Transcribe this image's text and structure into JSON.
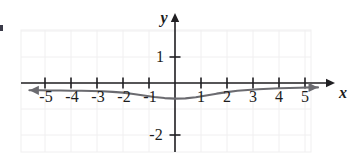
{
  "figure": {
    "kind": "cartesian-graph",
    "width": 349,
    "height": 159,
    "background": "#ffffff",
    "grid_color": "#f0eff0",
    "axis_color": "#201f22",
    "curve_color": "#6b6b70",
    "text_color": "#1c1c1c"
  },
  "axes": {
    "x_axis_label": "x",
    "y_axis_label": "y",
    "x_tick_labels": [
      "-5",
      "-4",
      "-3",
      "-2",
      "-1",
      "1",
      "2",
      "3",
      "4",
      "5"
    ],
    "y_tick_labels": [
      "1",
      "-2"
    ],
    "x_range": [
      -5.9,
      6.0
    ],
    "y_range": [
      -2.8,
      2.9
    ],
    "x_ticks": [
      -5,
      -4,
      -3,
      -2,
      -1,
      1,
      2,
      3,
      4,
      5
    ],
    "y_ticks": [
      1,
      -2
    ],
    "grid": true
  },
  "chart_data": {
    "type": "line",
    "title": "",
    "xlabel": "x",
    "ylabel": "y",
    "xlim": [
      -5.9,
      6.0
    ],
    "ylim": [
      -2.8,
      2.9
    ],
    "grid": true,
    "legend": "none",
    "series": [
      {
        "name": "curve",
        "color": "#6b6b70",
        "arrows": "both",
        "x": [
          -5.6,
          -5.2,
          -4.8,
          -4.4,
          -4.0,
          -3.6,
          -3.2,
          -2.8,
          -2.4,
          -2.0,
          -1.6,
          -1.2,
          -0.8,
          -0.4,
          0.0,
          0.4,
          0.8,
          1.2,
          1.6,
          2.0,
          2.4,
          2.8,
          3.2,
          3.6,
          4.0,
          4.4,
          4.8,
          5.2,
          5.5
        ],
        "y": [
          -0.28,
          -0.28,
          -0.29,
          -0.29,
          -0.3,
          -0.3,
          -0.31,
          -0.32,
          -0.34,
          -0.37,
          -0.42,
          -0.48,
          -0.54,
          -0.58,
          -0.6,
          -0.59,
          -0.55,
          -0.48,
          -0.41,
          -0.35,
          -0.3,
          -0.27,
          -0.24,
          -0.22,
          -0.2,
          -0.19,
          -0.18,
          -0.17,
          -0.17
        ]
      }
    ],
    "annotations": []
  }
}
